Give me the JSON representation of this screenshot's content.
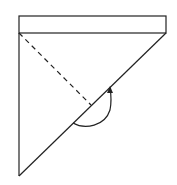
{
  "diagram": {
    "type": "paper-folding",
    "stroke_color": "#222222",
    "background": "#ffffff",
    "strip": {
      "x": 19,
      "y": 16,
      "width": 147,
      "height": 17
    },
    "left_edge": {
      "x1": 19,
      "y1": 33,
      "x2": 19,
      "y2": 176
    },
    "diagonal": {
      "x1": 166,
      "y1": 33,
      "x2": 19,
      "y2": 176
    },
    "dashed_line": {
      "x1": 19,
      "y1": 33,
      "x2": 91,
      "y2": 105
    },
    "arrow": {
      "path": "M73,123 C85,130 105,126 110,110 C112,100 111,94 110,88",
      "head": "110,86 107,93 113,93"
    }
  }
}
